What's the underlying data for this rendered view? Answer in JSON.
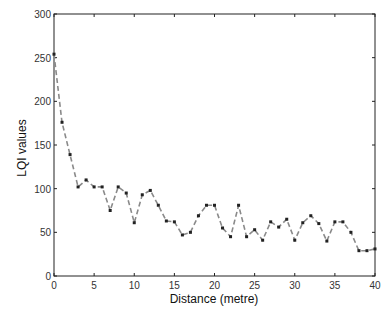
{
  "chart_data": {
    "type": "line",
    "title": "",
    "xlabel": "Distance (metre)",
    "ylabel": "LQI values",
    "xlim": [
      0,
      40
    ],
    "ylim": [
      0,
      300
    ],
    "xticks": [
      0,
      5,
      10,
      15,
      20,
      25,
      30,
      35,
      40
    ],
    "yticks": [
      0,
      50,
      100,
      150,
      200,
      250,
      300
    ],
    "xtick_labels": [
      "0",
      "5",
      "10",
      "15",
      "20",
      "25",
      "30",
      "35",
      "40"
    ],
    "ytick_labels": [
      "0",
      "50",
      "100",
      "150",
      "200",
      "250",
      "300"
    ],
    "grid": false,
    "legend": null,
    "series": [
      {
        "name": "LQI",
        "line_style": "dashed",
        "marker": "square",
        "color": "#8a8a8a",
        "marker_color": "#222222",
        "x": [
          0,
          1,
          2,
          3,
          4,
          5,
          6,
          7,
          8,
          9,
          10,
          11,
          12,
          13,
          14,
          15,
          16,
          17,
          18,
          19,
          20,
          21,
          22,
          23,
          24,
          25,
          26,
          27,
          28,
          29,
          30,
          31,
          32,
          33,
          34,
          35,
          36,
          37,
          38,
          39,
          40
        ],
        "y": [
          254,
          176,
          139,
          102,
          110,
          102,
          102,
          75,
          102,
          95,
          61,
          93,
          98,
          81,
          63,
          62,
          47,
          50,
          69,
          81,
          81,
          55,
          45,
          81,
          45,
          53,
          41,
          62,
          56,
          65,
          41,
          61,
          69,
          60,
          40,
          62,
          62,
          50,
          29,
          29,
          31
        ]
      }
    ]
  }
}
